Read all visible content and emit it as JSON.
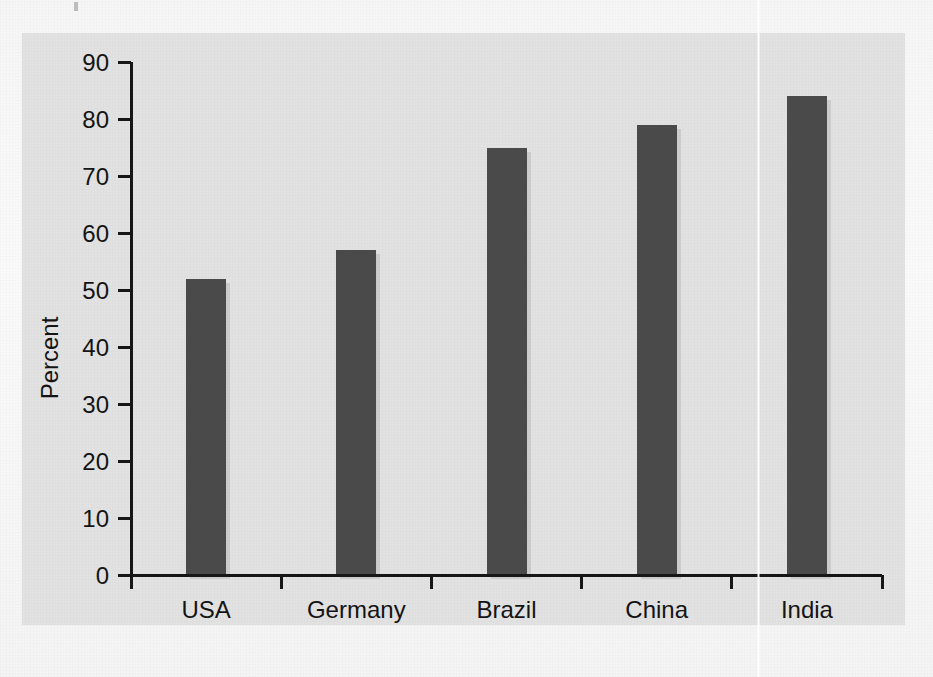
{
  "chart_data": {
    "type": "bar",
    "title": "",
    "subtitle": "",
    "xlabel": "",
    "ylabel": "Percent",
    "categories": [
      "USA",
      "Germany",
      "Brazil",
      "China",
      "India"
    ],
    "values": [
      52,
      57,
      75,
      79,
      84
    ],
    "series": [
      {
        "name": "Percent",
        "values": [
          52,
          57,
          75,
          79,
          84
        ]
      }
    ],
    "ylim": [
      0,
      90
    ],
    "ytick_labels": [
      "0",
      "10",
      "20",
      "30",
      "40",
      "50",
      "60",
      "70",
      "80",
      "90"
    ],
    "ytick_values": [
      0,
      10,
      20,
      30,
      40,
      50,
      60,
      70,
      80,
      90
    ],
    "grid": false,
    "legend": null,
    "legend_position": "none",
    "annotations": []
  },
  "style": {
    "bar_color": "#4a4a4a",
    "bar_shadow_color": "#b9b9b9",
    "axis_color": "#161616",
    "text_color": "#141414",
    "panel_background": "#e2e2e2",
    "page_background": "#f7f7f7"
  },
  "axis": {
    "y_title": "Percent"
  }
}
